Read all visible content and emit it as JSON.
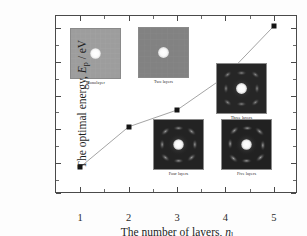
{
  "chart_data": {
    "type": "line",
    "title": "",
    "xlabel": "The number of layers, n_l",
    "ylabel": "The optimal energy, E_p / eV",
    "x": [
      1,
      2,
      3,
      4,
      5
    ],
    "values": [
      280,
      400,
      450,
      550,
      700
    ],
    "categories": [
      "1",
      "2",
      "3",
      "4",
      "5"
    ],
    "series": [
      {
        "name": "optimal energy",
        "values": [
          280,
          400,
          450,
          550,
          700
        ],
        "marker": "filled-square",
        "marker_color": "#141414",
        "line_color": "#9a9a9a"
      }
    ],
    "xlim": [
      0.5,
      5.5
    ],
    "ylim": [
      200,
      730
    ],
    "xticks": [
      1,
      2,
      3,
      4,
      5
    ],
    "yticks": [
      200,
      300,
      400,
      500,
      600,
      700
    ],
    "grid": false,
    "legend": "none",
    "minor_ticks": true
  },
  "axes": {
    "y_title_prefix": "The optimal energy, ",
    "y_title_symbol": "E",
    "y_title_subscript": "p",
    "y_title_suffix": " / eV",
    "x_title_prefix": "The number of layers, ",
    "x_title_symbol": "n",
    "x_title_subscript": "l",
    "ytick_labels": [
      "700",
      "600",
      "500",
      "400",
      "300",
      "200"
    ],
    "xtick_labels": [
      "1",
      "2",
      "3",
      "4",
      "5"
    ]
  },
  "insets": [
    {
      "caption": "Monolayer",
      "style": "light-uniform"
    },
    {
      "caption": "Two layers",
      "style": "medium-uniform"
    },
    {
      "caption": "Three layers",
      "style": "dark-diffraction"
    },
    {
      "caption": "Four layers",
      "style": "dark-diffraction"
    },
    {
      "caption": "Five layers",
      "style": "dark-diffraction"
    }
  ],
  "colors": {
    "frame": "#4a4a4a",
    "marker": "#141414",
    "line": "#9a9a9a",
    "background": "#ffffff",
    "text": "#1e1e1e"
  }
}
